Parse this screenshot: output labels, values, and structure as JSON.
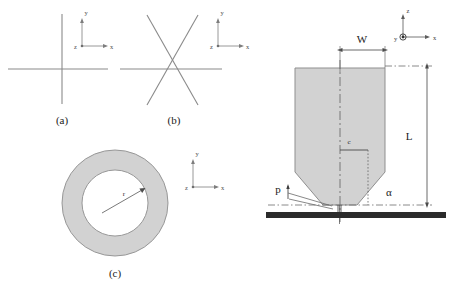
{
  "figure": {
    "background": "#ffffff",
    "line_color": "#8a8a8a",
    "dark_line_color": "#3a3a3a",
    "fill_gray": "#d2d2d2",
    "plate_color": "#2b2b2b"
  },
  "panels": [
    {
      "id": "a",
      "caption": "(a)",
      "kind": "cross",
      "axes": {
        "up": "y",
        "right": "x",
        "origin": "z"
      }
    },
    {
      "id": "b",
      "caption": "(b)",
      "kind": "six-pointed-asterisk",
      "axes": {
        "up": "y",
        "right": "x",
        "origin": "z"
      }
    },
    {
      "id": "c",
      "caption": "(c)",
      "kind": "annulus",
      "radius_label": "r",
      "axes": {
        "up": "y",
        "right": "x",
        "origin": "z"
      }
    },
    {
      "id": "d",
      "kind": "tapered-specimen",
      "axes": {
        "up": "z",
        "right": "x",
        "origin": "y"
      },
      "labels": {
        "width": "W",
        "length": "L",
        "crack": "c",
        "angle": "α",
        "load": "p"
      }
    }
  ]
}
